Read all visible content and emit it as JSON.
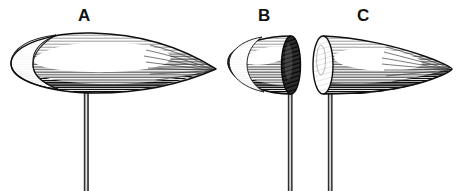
{
  "figure": {
    "title": "",
    "background_color": "#ffffff",
    "ink_color": "#1a1a1a",
    "width": 470,
    "height": 191,
    "style": "engraving-hatched-line-art",
    "labels": [
      {
        "id": "A",
        "text": "A",
        "x": 78,
        "y": 7
      },
      {
        "id": "B",
        "text": "B",
        "x": 258,
        "y": 7
      },
      {
        "id": "C",
        "text": "C",
        "x": 357,
        "y": 7
      }
    ],
    "specimens": [
      {
        "id": "A",
        "name": "whole-ogive-specimen",
        "description": "complete elongated teardrop form, blunt rounded left end, tapering to a sharp point at right",
        "bounds": {
          "x": 10,
          "y": 33,
          "width": 206,
          "height": 60
        },
        "tip_point": {
          "x": 216,
          "y": 69
        },
        "blunt_end": {
          "x": 11,
          "y": 64
        },
        "shading": "horizontal-hatching",
        "highlight": "upper-left-white",
        "pin": {
          "x": 86,
          "y_top": 91,
          "y_bottom": 191,
          "width": 4
        }
      },
      {
        "id": "B",
        "name": "blunt-rear-section",
        "description": "rear half of the form cut transversely, dark elliptical section face on the right",
        "bounds": {
          "x": 228,
          "y": 36,
          "width": 72,
          "height": 58
        },
        "blunt_end": {
          "x": 229,
          "y": 65
        },
        "cut_face": {
          "center_x": 291,
          "center_y": 65,
          "rx": 9,
          "ry": 29,
          "tone": "dark",
          "hatching": "radial-dense"
        },
        "shading": "horizontal-hatching",
        "highlight": "upper-left-white",
        "pin": {
          "x": 290,
          "y_top": 93,
          "y_bottom": 191,
          "width": 4
        }
      },
      {
        "id": "C",
        "name": "pointed-front-section",
        "description": "front half of the form cut transversely, light elliptical section face on the left, tapering to a sharp point at right",
        "bounds": {
          "x": 313,
          "y": 36,
          "width": 139,
          "height": 58
        },
        "tip_point": {
          "x": 452,
          "y": 69
        },
        "cut_face": {
          "center_x": 323,
          "center_y": 65,
          "rx": 10,
          "ry": 29,
          "tone": "light",
          "hatching": "radial-fine"
        },
        "shading": "horizontal-hatching",
        "highlight": "upper-left-white",
        "pin": {
          "x": 330,
          "y_top": 93,
          "y_bottom": 191,
          "width": 4
        }
      }
    ],
    "pin_label": "mounting-pin"
  }
}
